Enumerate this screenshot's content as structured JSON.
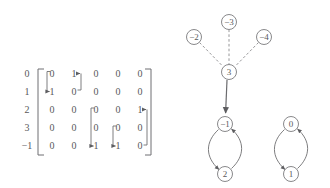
{
  "matrix": {
    "row_labels": [
      "0",
      "1",
      "2",
      "3",
      "−1"
    ],
    "rows": [
      [
        "0",
        "1",
        "0",
        "0",
        "0"
      ],
      [
        "1",
        "0",
        "0",
        "0",
        "0"
      ],
      [
        "0",
        "0",
        "0",
        "0",
        "1"
      ],
      [
        "0",
        "0",
        "0",
        "0",
        "0"
      ],
      [
        "0",
        "0",
        "1",
        "1",
        "0"
      ]
    ],
    "bracket_annotations": [
      {
        "name": "pair-0-1",
        "from": "r0c1",
        "to": "r1c0"
      },
      {
        "name": "pair-2-4",
        "from": "r2c4",
        "to": "r4c2"
      },
      {
        "name": "pair-3-4",
        "from": "r3c3",
        "to": "r4c3"
      }
    ]
  },
  "graph": {
    "nodes": [
      {
        "id": "n-2",
        "label": "−2",
        "cx": 194,
        "cy": 37,
        "r": 7.5
      },
      {
        "id": "n-3",
        "label": "−3",
        "cx": 229,
        "cy": 22,
        "r": 7.5
      },
      {
        "id": "n-4",
        "label": "−4",
        "cx": 264,
        "cy": 37,
        "r": 7.5
      },
      {
        "id": "n3",
        "label": "3",
        "cx": 229,
        "cy": 72,
        "r": 7.5
      },
      {
        "id": "n-1",
        "label": "−1",
        "cx": 225,
        "cy": 124,
        "r": 7.5
      },
      {
        "id": "n2",
        "label": "2",
        "cx": 225,
        "cy": 174,
        "r": 7.5
      },
      {
        "id": "n0",
        "label": "0",
        "cx": 291,
        "cy": 124,
        "r": 7.5
      },
      {
        "id": "n1",
        "label": "1",
        "cx": 291,
        "cy": 174,
        "r": 7.5
      }
    ],
    "edges": [
      {
        "name": "edge-minus2-to-3",
        "from": "−2",
        "to": "3",
        "style": "dashed",
        "arrow": false
      },
      {
        "name": "edge-minus3-to-3",
        "from": "−3",
        "to": "3",
        "style": "dashed",
        "arrow": false
      },
      {
        "name": "edge-minus4-to-3",
        "from": "−4",
        "to": "3",
        "style": "dashed",
        "arrow": false
      },
      {
        "name": "edge-3-to-minus1",
        "from": "3",
        "to": "−1",
        "style": "solid",
        "arrow": true
      },
      {
        "name": "edge-minus1-to-2",
        "from": "−1",
        "to": "2",
        "style": "solid",
        "arrow": true
      },
      {
        "name": "edge-2-to-minus1",
        "from": "2",
        "to": "−1",
        "style": "solid",
        "arrow": true
      },
      {
        "name": "edge-0-to-1",
        "from": "0",
        "to": "1",
        "style": "solid",
        "arrow": true
      },
      {
        "name": "edge-1-to-0",
        "from": "1",
        "to": "0",
        "style": "solid",
        "arrow": true
      }
    ]
  },
  "colors": {
    "ink": "#58585a",
    "rule": "#6f6f72",
    "dashed": "#8a8a8d",
    "background": "#ffffff"
  }
}
